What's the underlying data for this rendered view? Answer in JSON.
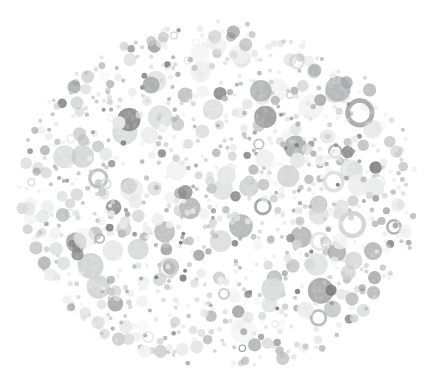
{
  "image": {
    "kind": "ishihara-plate",
    "title": "Ishihara colour vision test plate (grayscale)",
    "width": 436,
    "height": 392,
    "background_color": "#ffffff",
    "hidden_figure_visible": false,
    "hidden_figure_label": ""
  },
  "plate": {
    "shape": "ellipse",
    "center_x": 219,
    "center_y": 196,
    "radius_x": 202,
    "radius_y": 174,
    "edge_softness": 0.055,
    "boundary_jitter": 0.028,
    "dot_count": 960,
    "dot_min_diameter": 4,
    "dot_max_diameter": 26,
    "dot_opacity_min": 0.55,
    "dot_opacity_max": 1.0,
    "ring_dot_fraction": 0.08,
    "speckle_strength": 0.1,
    "random_seed": 20240517
  },
  "palette": {
    "dark_grays": [
      "#7e7e7e",
      "#888888",
      "#8f9093",
      "#969696",
      "#9ea0a0",
      "#a3a5a6"
    ],
    "mid_grays": [
      "#aeaeae",
      "#b5b6b7",
      "#bdbdbd",
      "#c3c4c5",
      "#cacaca"
    ],
    "light_grays": [
      "#d3d4d4",
      "#dadbdb",
      "#e0e1e1",
      "#e6e7e7",
      "#ecedec",
      "#f1f2f1"
    ],
    "weights": {
      "dark": 0.2,
      "mid": 0.3,
      "light": 0.5
    }
  },
  "chart_data": {
    "type": "scatter",
    "title": "Ishihara colour vision test plate (grayscale)",
    "subtitle": "",
    "xlabel": "",
    "ylabel": "",
    "xlim": [
      0,
      436
    ],
    "ylim": [
      0,
      392
    ],
    "grid": false,
    "legend": "none",
    "marker": "circle",
    "point_count": 960,
    "size_range_px": [
      4,
      26
    ],
    "value_range_gray": [
      "#7e7e7e",
      "#f1f2f1"
    ]
  }
}
